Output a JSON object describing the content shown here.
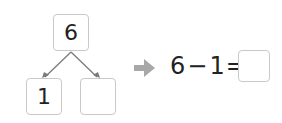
{
  "diagram": {
    "whole": "6",
    "part_known": "1",
    "part_unknown": ""
  },
  "equation": {
    "left": "6",
    "operator": "−",
    "right": "1",
    "equals": "=",
    "answer": ""
  },
  "colors": {
    "box_border": "#c9c9c9",
    "arrow": "#a8a8a8",
    "line": "#7a7a7a"
  }
}
